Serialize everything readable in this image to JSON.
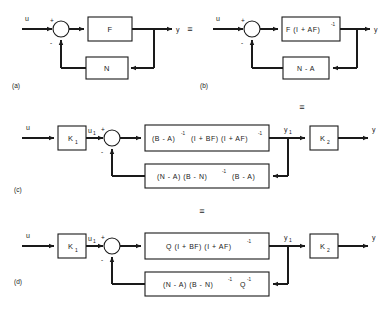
{
  "figure": {
    "type": "control-system-block-diagram",
    "background_color": "#ffffff",
    "line_color": "#1a1a1a",
    "equivalence_symbol": "≡",
    "signs": {
      "plus": "+",
      "minus": "-"
    },
    "signals": {
      "input": "u",
      "output": "y",
      "intermediate_input": "u",
      "intermediate_input_sub": "1",
      "intermediate_output": "y",
      "intermediate_output_sub": "1"
    }
  },
  "panels": [
    {
      "id": "a",
      "label": "(a)",
      "input_label": "u",
      "output_label": "y",
      "forward_block": "F",
      "feedback_block": "N",
      "sum_plus": "+",
      "sum_minus": "-"
    },
    {
      "id": "b",
      "label": "(b)",
      "input_label": "u",
      "output_label": "y",
      "forward_block": {
        "base": "F (I + AF)",
        "exponent": "-1",
        "full": "F (I + AF)^-1"
      },
      "feedback_block": "N - A",
      "sum_plus": "+",
      "sum_minus": "-"
    },
    {
      "id": "c",
      "label": "(c)",
      "input_label": "u",
      "output_label": "y",
      "pre_gain": {
        "base": "K",
        "sub": "1"
      },
      "post_gain": {
        "base": "K",
        "sub": "2"
      },
      "mid_input": {
        "base": "u",
        "sub": "1"
      },
      "mid_output": {
        "base": "y",
        "sub": "1"
      },
      "forward_block": {
        "part1": "(B - A)",
        "sup1": "-1",
        "part2": "(I + BF) (I + AF)",
        "sup2": "-1",
        "full": "(B - A)^-1 (I + BF)(I + AF)^-1"
      },
      "feedback_block": {
        "part1": "(N - A) (B - N)",
        "sup1": "-1",
        "part2": "(B - A)",
        "full": "(N - A) (B - N)^-1 (B - A)"
      },
      "sum_plus": "+",
      "sum_minus": "-"
    },
    {
      "id": "d",
      "label": "(d)",
      "input_label": "u",
      "output_label": "y",
      "pre_gain": {
        "base": "K",
        "sub": "1"
      },
      "post_gain": {
        "base": "K",
        "sub": "2"
      },
      "mid_input": {
        "base": "u",
        "sub": "1"
      },
      "mid_output": {
        "base": "y",
        "sub": "1"
      },
      "forward_block": {
        "part1": "Q (I + BF) (I + AF)",
        "sup1": "-1",
        "full": "Q (I + BF) (I + AF)^-1"
      },
      "feedback_block": {
        "part1": "(N - A) (B - N)",
        "sup1": "-1",
        "part2": "Q",
        "sup2": "-1",
        "full": "(N - A) (B - N)^-1 Q^-1"
      },
      "sum_plus": "+",
      "sum_minus": "-"
    }
  ],
  "equivalences": [
    {
      "id": "eq-ab",
      "symbol": "≡"
    },
    {
      "id": "eq-bc",
      "symbol": "≡"
    },
    {
      "id": "eq-cd",
      "symbol": "≡"
    }
  ]
}
